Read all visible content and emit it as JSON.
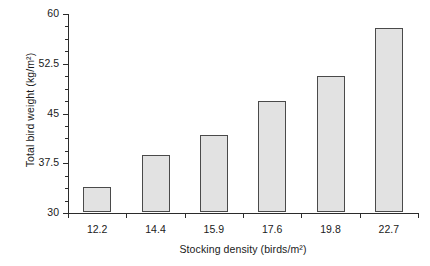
{
  "chart_data": {
    "type": "bar",
    "title": "",
    "subtitle": "",
    "xlabel": "Stocking density (birds/m²)",
    "ylabel": "Total bird weight (kg/m²)",
    "categories": [
      "12.2",
      "14.4",
      "15.9",
      "17.6",
      "19.8",
      "22.7"
    ],
    "values": [
      33.8,
      38.6,
      41.6,
      46.7,
      50.5,
      57.7
    ],
    "ylim": [
      30,
      60
    ],
    "ytick_labels": [
      "30",
      "37.5",
      "45",
      "52.5",
      "60"
    ],
    "ytick_values": [
      30,
      37.5,
      45,
      52.5,
      60
    ],
    "minor_tick_step": 1.875,
    "grid": false,
    "legend": false,
    "legend_position": "none",
    "bar_fill_color": "#e2e2e2",
    "bar_edge_color": "#4a4a4a",
    "axis_color": "#2b2b2b",
    "background_color": "#ffffff"
  }
}
